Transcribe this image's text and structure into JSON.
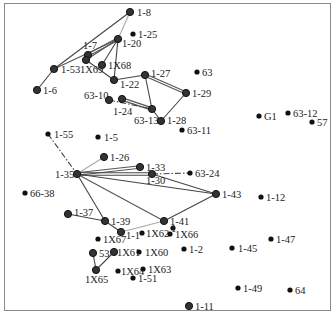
{
  "diagram": {
    "type": "network-graph",
    "nodes": [
      {
        "id": "1-8",
        "x": 130,
        "y": 12,
        "lx": 137,
        "ly": 16,
        "big": true
      },
      {
        "id": "1-25",
        "x": 133,
        "y": 34,
        "lx": 138,
        "ly": 38,
        "big": false
      },
      {
        "id": "1-20",
        "x": 118,
        "y": 39,
        "lx": 122,
        "ly": 47,
        "big": true
      },
      {
        "id": "1-7",
        "x": 88,
        "y": 55,
        "lx": 83,
        "ly": 49,
        "big": true
      },
      {
        "id": "1X69",
        "x": 86,
        "y": 60,
        "lx": 80,
        "ly": 73,
        "big": true
      },
      {
        "id": "1X68",
        "x": 102,
        "y": 65,
        "lx": 108,
        "ly": 69,
        "big": true
      },
      {
        "id": "1-53",
        "x": 54,
        "y": 69,
        "lx": 61,
        "ly": 73,
        "big": true
      },
      {
        "id": "1-6",
        "x": 37,
        "y": 90,
        "lx": 43,
        "ly": 94,
        "big": true
      },
      {
        "id": "1-22",
        "x": 114,
        "y": 80,
        "lx": 120,
        "ly": 88,
        "big": true
      },
      {
        "id": "1-27",
        "x": 145,
        "y": 75,
        "lx": 151,
        "ly": 77,
        "big": true
      },
      {
        "id": "63",
        "x": 197,
        "y": 72,
        "lx": 202,
        "ly": 76,
        "big": false
      },
      {
        "id": "1-29",
        "x": 186,
        "y": 93,
        "lx": 192,
        "ly": 97,
        "big": true
      },
      {
        "id": "63-10",
        "x": 109,
        "y": 100,
        "lx": 84,
        "ly": 99,
        "big": true
      },
      {
        "id": "1-24",
        "x": 122,
        "y": 99,
        "lx": 113,
        "ly": 115,
        "big": true
      },
      {
        "id": "63-13",
        "x": 152,
        "y": 109,
        "lx": 134,
        "ly": 124,
        "big": true
      },
      {
        "id": "1-28",
        "x": 161,
        "y": 121,
        "lx": 167,
        "ly": 124,
        "big": true
      },
      {
        "id": "63-11",
        "x": 182,
        "y": 130,
        "lx": 187,
        "ly": 134,
        "big": false
      },
      {
        "id": "G1",
        "x": 259,
        "y": 116,
        "lx": 264,
        "ly": 120,
        "big": false
      },
      {
        "id": "63-12",
        "x": 288,
        "y": 113,
        "lx": 293,
        "ly": 117,
        "big": false
      },
      {
        "id": "57",
        "x": 312,
        "y": 122,
        "lx": 317,
        "ly": 126,
        "big": false
      },
      {
        "id": "1-55",
        "x": 48,
        "y": 134,
        "lx": 54,
        "ly": 138,
        "big": false
      },
      {
        "id": "1-5",
        "x": 98,
        "y": 137,
        "lx": 104,
        "ly": 141,
        "big": false
      },
      {
        "id": "1-26",
        "x": 104,
        "y": 157,
        "lx": 110,
        "ly": 161,
        "big": true
      },
      {
        "id": "1-35",
        "x": 77,
        "y": 174,
        "lx": 55,
        "ly": 178,
        "big": true
      },
      {
        "id": "1-33",
        "x": 140,
        "y": 167,
        "lx": 146,
        "ly": 171,
        "big": true
      },
      {
        "id": "1-30",
        "x": 152,
        "y": 174,
        "lx": 146,
        "ly": 184,
        "big": true
      },
      {
        "id": "63-24",
        "x": 190,
        "y": 173,
        "lx": 195,
        "ly": 177,
        "big": false
      },
      {
        "id": "1-43",
        "x": 216,
        "y": 194,
        "lx": 222,
        "ly": 198,
        "big": true
      },
      {
        "id": "1-12",
        "x": 261,
        "y": 197,
        "lx": 266,
        "ly": 201,
        "big": false
      },
      {
        "id": "66-38",
        "x": 25,
        "y": 193,
        "lx": 30,
        "ly": 197,
        "big": false
      },
      {
        "id": "1-37",
        "x": 68,
        "y": 214,
        "lx": 74,
        "ly": 216,
        "big": true
      },
      {
        "id": "1-39",
        "x": 105,
        "y": 221,
        "lx": 111,
        "ly": 225,
        "big": true
      },
      {
        "id": "1-41",
        "x": 164,
        "y": 221,
        "lx": 170,
        "ly": 225,
        "big": true
      },
      {
        "id": "1",
        "x": 173,
        "y": 228,
        "lx": 171,
        "ly": 232,
        "big": false,
        "nolabeldot": false
      },
      {
        "id": "1-1",
        "x": 121,
        "y": 232,
        "lx": 126,
        "ly": 239,
        "big": true
      },
      {
        "id": "1X62",
        "x": 142,
        "y": 233,
        "lx": 146,
        "ly": 237,
        "big": false
      },
      {
        "id": "1X66",
        "x": 170,
        "y": 234,
        "lx": 175,
        "ly": 238,
        "big": false
      },
      {
        "id": "1X67",
        "x": 98,
        "y": 239,
        "lx": 103,
        "ly": 243,
        "big": false
      },
      {
        "id": "1-2",
        "x": 184,
        "y": 249,
        "lx": 189,
        "ly": 253,
        "big": false
      },
      {
        "id": "1-45",
        "x": 232,
        "y": 248,
        "lx": 238,
        "ly": 252,
        "big": false
      },
      {
        "id": "1-47",
        "x": 271,
        "y": 239,
        "lx": 276,
        "ly": 243,
        "big": false
      },
      {
        "id": "53",
        "x": 93,
        "y": 253,
        "lx": 99,
        "ly": 257,
        "big": true
      },
      {
        "id": "1X61",
        "x": 114,
        "y": 252,
        "lx": 117,
        "ly": 256,
        "big": true
      },
      {
        "id": "1X60",
        "x": 139,
        "y": 252,
        "lx": 145,
        "ly": 256,
        "big": false
      },
      {
        "id": "1X65",
        "x": 96,
        "y": 270,
        "lx": 85,
        "ly": 283,
        "big": true
      },
      {
        "id": "1X64",
        "x": 118,
        "y": 271,
        "lx": 121,
        "ly": 275,
        "big": false
      },
      {
        "id": "1X63",
        "x": 143,
        "y": 269,
        "lx": 148,
        "ly": 273,
        "big": false
      },
      {
        "id": "1-51",
        "x": 133,
        "y": 278,
        "lx": 138,
        "ly": 282,
        "big": false
      },
      {
        "id": "1-49",
        "x": 238,
        "y": 288,
        "lx": 243,
        "ly": 292,
        "big": false
      },
      {
        "id": "64",
        "x": 290,
        "y": 290,
        "lx": 295,
        "ly": 294,
        "big": false
      },
      {
        "id": "1-11",
        "x": 189,
        "y": 306,
        "lx": 195,
        "ly": 310,
        "big": true
      }
    ],
    "edges": [
      {
        "from": "1-8",
        "to": "1-53",
        "style": "solid",
        "color": "#444"
      },
      {
        "from": "1-8",
        "to": "1-20",
        "style": "solid",
        "color": "#aaa"
      },
      {
        "from": "1-53",
        "to": "1-6",
        "style": "solid",
        "color": "#444"
      },
      {
        "from": "1-53",
        "to": "1-20",
        "style": "solid",
        "color": "#555"
      },
      {
        "from": "1-7",
        "to": "1-20",
        "style": "double",
        "color": "#555"
      },
      {
        "from": "1X69",
        "to": "1-20",
        "style": "solid",
        "color": "#555"
      },
      {
        "from": "1X68",
        "to": "1-20",
        "style": "solid",
        "color": "#444"
      },
      {
        "from": "1-20",
        "to": "1-22",
        "style": "solid",
        "color": "#444"
      },
      {
        "from": "1X69",
        "to": "1-22",
        "style": "solid",
        "color": "#444"
      },
      {
        "from": "1-22",
        "to": "1-27",
        "style": "solid",
        "color": "#444"
      },
      {
        "from": "1-27",
        "to": "1-29",
        "style": "double",
        "color": "#555"
      },
      {
        "from": "1-27",
        "to": "63-13",
        "style": "solid",
        "color": "#444"
      },
      {
        "from": "1-29",
        "to": "1-28",
        "style": "solid",
        "color": "#444"
      },
      {
        "from": "1-28",
        "to": "63-13",
        "style": "solid",
        "color": "#444"
      },
      {
        "from": "1-24",
        "to": "63-13",
        "style": "double",
        "color": "#555"
      },
      {
        "from": "63-10",
        "to": "63-13",
        "style": "dashdot",
        "color": "#444"
      },
      {
        "from": "1-55",
        "to": "1-35",
        "style": "dashdot",
        "color": "#444"
      },
      {
        "from": "1-35",
        "to": "1-26",
        "style": "solid",
        "color": "#aaa"
      },
      {
        "from": "1-35",
        "to": "1-33",
        "style": "double",
        "color": "#555"
      },
      {
        "from": "1-35",
        "to": "1-30",
        "style": "double",
        "color": "#444"
      },
      {
        "from": "1-35",
        "to": "1-43",
        "style": "solid",
        "color": "#444"
      },
      {
        "from": "1-35",
        "to": "1-41",
        "style": "solid",
        "color": "#555"
      },
      {
        "from": "1-35",
        "to": "1-39",
        "style": "solid",
        "color": "#444"
      },
      {
        "from": "1-30",
        "to": "63-24",
        "style": "dashdot",
        "color": "#444"
      },
      {
        "from": "1-30",
        "to": "1-43",
        "style": "solid",
        "color": "#444"
      },
      {
        "from": "1-43",
        "to": "1-41",
        "style": "solid",
        "color": "#444"
      },
      {
        "from": "1-37",
        "to": "1-39",
        "style": "solid",
        "color": "#444"
      },
      {
        "from": "1-39",
        "to": "1-1",
        "style": "solid",
        "color": "#444"
      },
      {
        "from": "1-41",
        "to": "1-1",
        "style": "solid",
        "color": "#aaa"
      },
      {
        "from": "53",
        "to": "1X65",
        "style": "solid",
        "color": "#444"
      },
      {
        "from": "1X61",
        "to": "1X65",
        "style": "solid",
        "color": "#444"
      }
    ]
  },
  "colors": {
    "background": "#ffffff",
    "frame": "#8a8a8a",
    "node": "#111111",
    "label": "#222222"
  }
}
